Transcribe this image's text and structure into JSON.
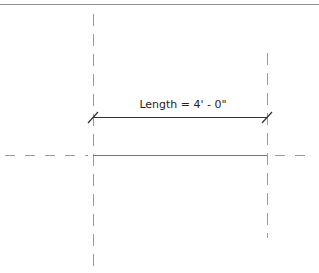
{
  "drawing": {
    "view_border_color": "#8c8c8c",
    "line_color": "#555555",
    "grid_line_color": "#9a9a9a",
    "dimension": {
      "label": "Length = 4' - 0\"",
      "x1": 93,
      "x2": 267,
      "y": 117
    },
    "reference_planes": {
      "vertical_left": {
        "x": 93,
        "y1": 14,
        "y2": 268
      },
      "vertical_right": {
        "x": 267,
        "y1": 53,
        "y2": 238
      },
      "horizontal": {
        "y": 155,
        "x1": 5,
        "x2": 310
      }
    },
    "model_line": {
      "x1": 93,
      "x2": 267,
      "y": 155
    }
  }
}
